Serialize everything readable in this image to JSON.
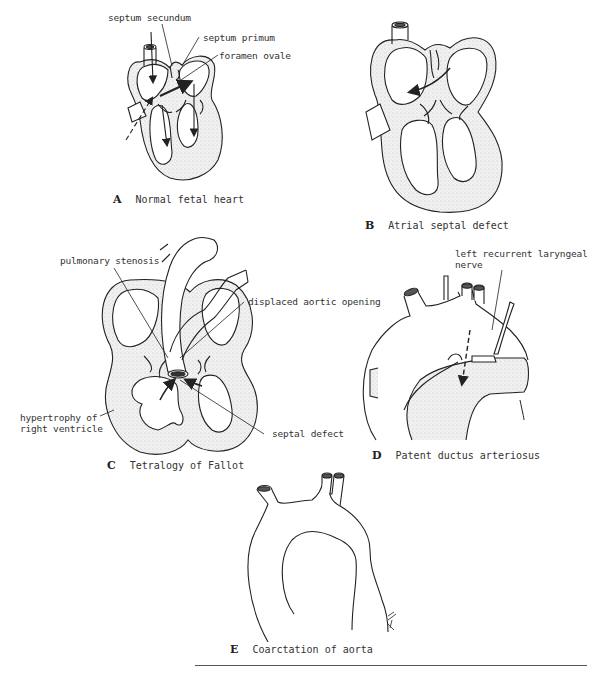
{
  "panels": {
    "A": {
      "letter": "A",
      "caption": "Normal fetal heart",
      "labels": {
        "septum_secundum": "septum secundum",
        "septum_primum": "septum primum",
        "foramen_ovale": "foramen ovale"
      }
    },
    "B": {
      "letter": "B",
      "caption": "Atrial septal defect"
    },
    "C": {
      "letter": "C",
      "caption": "Tetralogy of Fallot",
      "labels": {
        "pulmonary_stenosis": "pulmonary stenosis",
        "displaced_aortic_opening": "displaced aortic opening",
        "hypertrophy_line1": "hypertrophy of",
        "hypertrophy_line2": "right ventricle",
        "septal_defect": "septal defect"
      }
    },
    "D": {
      "letter": "D",
      "caption": "Patent ductus arteriosus",
      "labels": {
        "nerve_line1": "left recurrent laryngeal",
        "nerve_line2": "nerve"
      }
    },
    "E": {
      "letter": "E",
      "caption": "Coarctation of aorta"
    }
  },
  "colors": {
    "line": "#222222",
    "wall_fill": "#ececec",
    "background": "#ffffff"
  }
}
